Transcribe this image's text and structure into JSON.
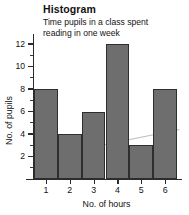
{
  "chart_data": {
    "type": "bar",
    "title": "Histogram",
    "subtitle": "Time pupils in a class spent\nreading in one week",
    "categories": [
      "1",
      "2",
      "3",
      "4",
      "5",
      "6"
    ],
    "values": [
      8,
      4,
      6,
      12,
      3,
      8
    ],
    "xlabel": "No. of hours",
    "ylabel": "No. of pupils",
    "ylim": [
      0,
      13
    ],
    "y_ticks_major": [
      2,
      4,
      6,
      8,
      10,
      12
    ],
    "y_tick_labels": [
      "2",
      "4",
      "6",
      "8",
      "10",
      "12"
    ],
    "y_ticks_minor": [
      1,
      3,
      5,
      7,
      9,
      11
    ],
    "grid": false,
    "legend": "none",
    "bar_color": "#6e6e6e",
    "bar_edge_color": "#2e2e2e",
    "axis_color": "#2b2b2b",
    "bars_contiguous": true,
    "annotations": [
      {
        "name": "trend-line",
        "type": "line",
        "color": "#bdbdbd",
        "x_start": 1,
        "y_start": 2.0,
        "x_end": 6.6,
        "y_end": 4.4
      }
    ]
  }
}
